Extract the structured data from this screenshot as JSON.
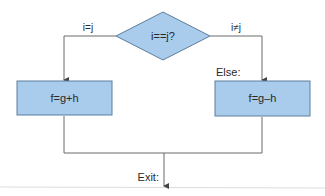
{
  "diagram": {
    "type": "flowchart",
    "decision": {
      "label": "i==j?",
      "fill": "#a9ccec",
      "stroke": "#5d7e9e"
    },
    "branches": {
      "true": {
        "edge_label": "i=j",
        "box_label": "f=g+h"
      },
      "false": {
        "edge_label": "i≠j",
        "box_label": "f=g–h",
        "block_label": "Else:"
      }
    },
    "exit_label": "Exit:",
    "colors": {
      "box_fill": "#a9ccec",
      "box_stroke": "#5d7e9e",
      "line": "#6b6b6b",
      "text": "#2a2a2a"
    }
  }
}
